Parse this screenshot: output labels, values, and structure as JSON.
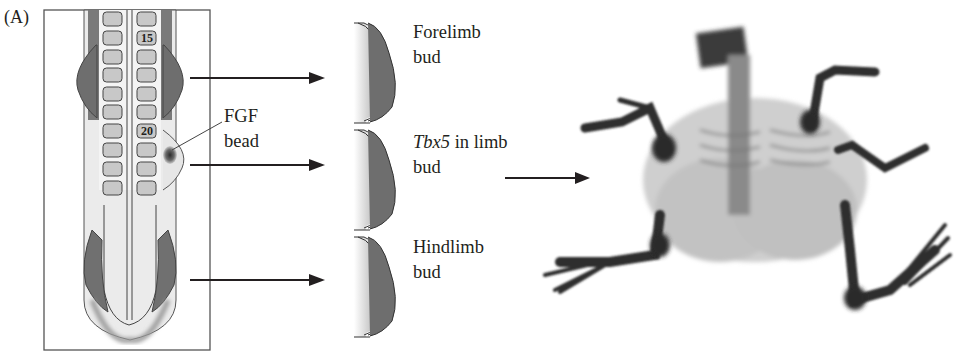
{
  "figure": {
    "panel_label": "(A)",
    "embryo": {
      "somite_labels": [
        "15",
        "20"
      ],
      "bead_label_line1": "FGF",
      "bead_label_line2": "bead"
    },
    "buds": [
      {
        "line1": "Forelimb",
        "line1_italic": "",
        "line2": "bud"
      },
      {
        "line1": " in limb",
        "line1_italic": "Tbx5",
        "line2": "bud"
      },
      {
        "line1": "Hindlimb",
        "line1_italic": "",
        "line2": "bud"
      }
    ],
    "result_image": "chick-embryo-skeleton-with-extra-limb"
  },
  "colors": {
    "ink": "#231f20",
    "dark_tissue": "#6e6e6e",
    "somite_fill": "#c8c8c8",
    "light_tissue": "#ececec"
  }
}
